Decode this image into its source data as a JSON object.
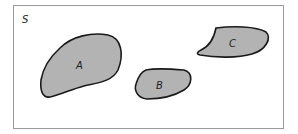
{
  "diagram": {
    "type": "venn",
    "universe_label": "S",
    "sets": [
      {
        "label": "A",
        "fill": "#b3b3b3"
      },
      {
        "label": "B",
        "fill": "#b3b3b3"
      },
      {
        "label": "C",
        "fill": "#b3b3b3"
      }
    ],
    "colors": {
      "frame": "#9a9a9a",
      "outline": "#1a1a1a",
      "fill": "#b3b3b3",
      "background": "#ffffff"
    }
  }
}
